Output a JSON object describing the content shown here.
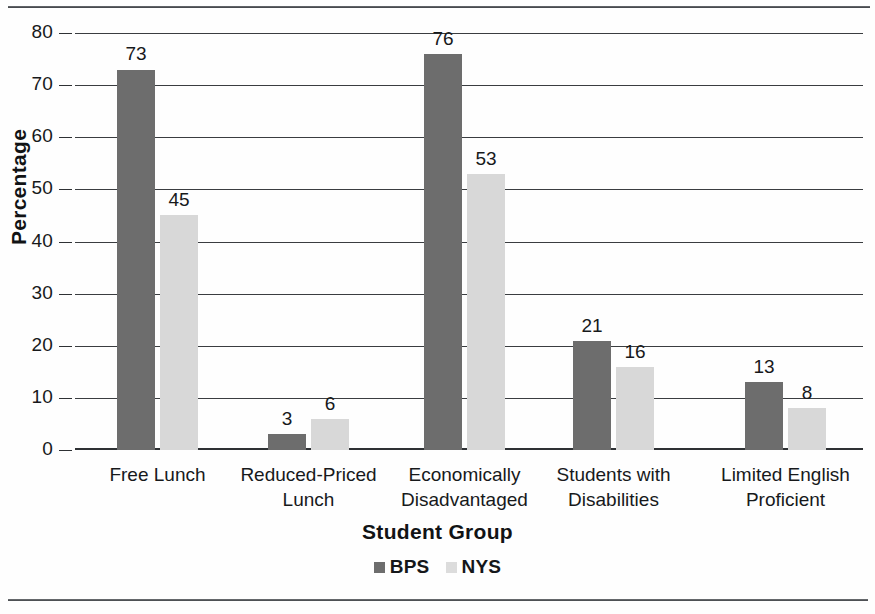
{
  "chart_data": {
    "type": "bar",
    "title": "",
    "xlabel": "Student Group",
    "ylabel": "Percentage",
    "ylim": [
      0,
      80
    ],
    "ytick_step": 10,
    "yticks": [
      "0",
      "10",
      "20",
      "30",
      "40",
      "50",
      "60",
      "70",
      "80"
    ],
    "grid": true,
    "legend_position": "bottom-center",
    "categories": [
      "Free Lunch",
      "Reduced-Priced\nLunch",
      "Economically\nDisadvantaged",
      "Students with\nDisabilities",
      "Limited English\nProficient"
    ],
    "series": [
      {
        "name": "BPS",
        "color": "#6d6d6d",
        "values": [
          73,
          3,
          76,
          21,
          13
        ]
      },
      {
        "name": "NYS",
        "color": "#d8d8d8",
        "values": [
          45,
          6,
          53,
          16,
          8
        ]
      }
    ],
    "data_labels": {
      "BPS": [
        "73",
        "3",
        "76",
        "21",
        "13"
      ],
      "NYS": [
        "45",
        "6",
        "53",
        "16",
        "8"
      ]
    }
  },
  "legend": {
    "items": [
      {
        "label": "BPS",
        "swatch": "legend-swatch-bps"
      },
      {
        "label": "NYS",
        "swatch": "legend-swatch-nys"
      }
    ]
  }
}
